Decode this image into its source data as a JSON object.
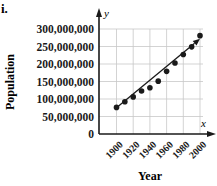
{
  "panel_label": "i.",
  "chart_data": {
    "type": "scatter",
    "title": "",
    "xlabel": "Year",
    "ylabel": "Population",
    "x_axis_var": "x",
    "y_axis_var": "y",
    "x_ticks": [
      1900,
      1920,
      1940,
      1960,
      1980,
      2000
    ],
    "x_tick_labels": [
      "1900",
      "1920",
      "1940",
      "1960",
      "1980",
      "2000"
    ],
    "y_ticks": [
      0,
      50000000,
      100000000,
      150000000,
      200000000,
      250000000,
      300000000
    ],
    "y_tick_labels": [
      "0",
      "50,000,000",
      "100,000,000",
      "150,000,000",
      "200,000,000",
      "250,000,000",
      "300,000,000"
    ],
    "xlim": [
      1890,
      2010
    ],
    "ylim": [
      0,
      300000000
    ],
    "grid": true,
    "legend": null,
    "series": [
      {
        "name": "Population",
        "marker": "filled-circle",
        "x": [
          1900,
          1910,
          1920,
          1930,
          1940,
          1950,
          1960,
          1970,
          1980,
          1990,
          2000
        ],
        "y": [
          76000000,
          92000000,
          106000000,
          123000000,
          132000000,
          151000000,
          179000000,
          203000000,
          227000000,
          249000000,
          281000000
        ]
      }
    ],
    "trend_line": {
      "type": "linear-fit-arrow",
      "start": {
        "x": 1900,
        "y": 75000000
      },
      "end": {
        "x": 2000,
        "y": 272000000
      }
    }
  },
  "colors": {
    "ink": "#1a1a1a",
    "grid": "#c8c8c8",
    "background": "#ffffff"
  }
}
